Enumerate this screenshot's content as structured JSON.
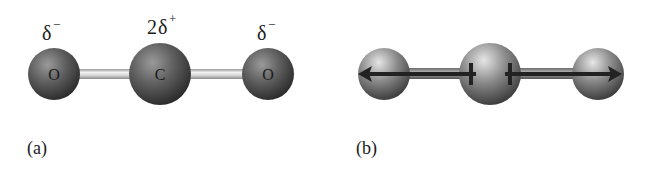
{
  "figure": {
    "molecule": "CO2",
    "panel_a": {
      "label": "(a)",
      "atoms": [
        {
          "symbol": "O",
          "charge_base": "δ",
          "charge_sign": "−",
          "charge_coef": ""
        },
        {
          "symbol": "C",
          "charge_base": "δ",
          "charge_sign": "+",
          "charge_coef": "2"
        },
        {
          "symbol": "O",
          "charge_base": "δ",
          "charge_sign": "−",
          "charge_coef": ""
        }
      ],
      "bond_type": "double"
    },
    "panel_b": {
      "label": "(b)",
      "description": "Bond dipoles pointing from C toward each O, equal and opposite",
      "dipole_arrows": [
        {
          "from": "C",
          "to": "O (left)",
          "direction": "left"
        },
        {
          "from": "C",
          "to": "O (right)",
          "direction": "right"
        }
      ]
    },
    "colors": {
      "atom_dark": "#2e2e2e",
      "atom_mid": "#6e6e6e",
      "atom_highlight": "#d8d8d8",
      "bond_a": "#c8c8c8",
      "bond_b": "#555555",
      "arrow": "#222222",
      "text": "#1a1a1a"
    }
  }
}
